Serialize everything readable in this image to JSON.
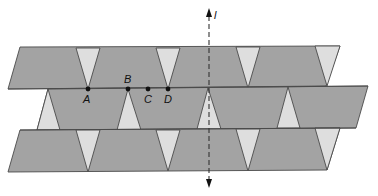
{
  "figure": {
    "axis_label": "l",
    "points": [
      {
        "label": "A",
        "x": 88,
        "y": 89,
        "label_x": 83,
        "label_y": 103
      },
      {
        "label": "B",
        "x": 128,
        "y": 89,
        "label_x": 124,
        "label_y": 83
      },
      {
        "label": "C",
        "x": 148,
        "y": 89,
        "label_x": 144,
        "label_y": 103
      },
      {
        "label": "D",
        "x": 168,
        "y": 89,
        "label_x": 164,
        "label_y": 103
      }
    ],
    "colors": {
      "tile": "#a3a3a3",
      "gap": "#dedede",
      "stroke": "#4a4a4a"
    }
  }
}
